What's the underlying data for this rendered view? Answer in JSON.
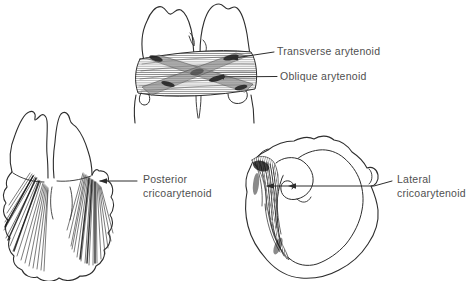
{
  "canvas": {
    "width": 467,
    "height": 281,
    "background_color": "#ffffff",
    "line_color": "#2d2d2d",
    "label_color": "#4f4f4f"
  },
  "labels": {
    "transverse_arytenoid": "Transverse arytenoid",
    "oblique_arytenoid": "Oblique arytenoid",
    "posterior_line1": "Posterior",
    "posterior_line2": "cricoarytenoid",
    "lateral_line1": "Lateral",
    "lateral_line2": "cricoarytenoid"
  }
}
